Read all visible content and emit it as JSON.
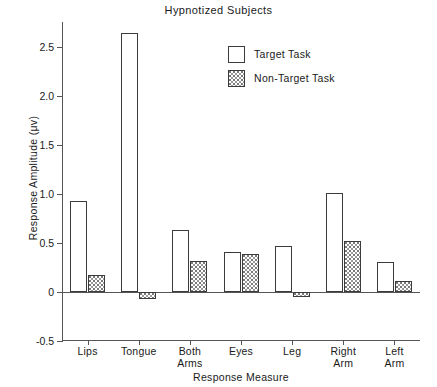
{
  "chart_data": {
    "type": "bar",
    "title": "Hypnotized Subjects",
    "xlabel": "Response Measure",
    "ylabel": "Response Amplitude (μv)",
    "categories": [
      "Lips",
      "Tongue",
      "Both\nArms",
      "Eyes",
      "Leg",
      "Right\nArm",
      "Left\nArm"
    ],
    "series": [
      {
        "name": "Target Task",
        "values": [
          0.93,
          2.64,
          0.63,
          0.41,
          0.47,
          1.01,
          0.31
        ]
      },
      {
        "name": "Non-Target Task",
        "values": [
          0.17,
          -0.07,
          0.32,
          0.39,
          -0.05,
          0.52,
          0.11
        ]
      }
    ],
    "ylim": [
      -0.5,
      2.75
    ],
    "yticks": [
      2.5,
      2.0,
      1.5,
      1.0,
      0.5,
      0,
      -0.5
    ],
    "ytick_labels": [
      "2.5",
      "2.0",
      "1.5",
      "1.0",
      "0.5",
      "0",
      "-0.5"
    ],
    "grid": false,
    "legend_position": "upper-right-inside",
    "zero_line": true
  },
  "legend": {
    "entries": [
      {
        "label": "Target Task",
        "style": "open-white-box"
      },
      {
        "label": "Non-Target Task",
        "style": "stippled-box"
      }
    ]
  },
  "colors": {
    "bar_outline": "#3b3b3b",
    "target_fill": "#ffffff",
    "nontarget_fill": "#ffffff",
    "nontarget_stipple": "#8a8a8a",
    "axis": "#555555",
    "text": "#1a1a1a",
    "background": "#ffffff"
  }
}
